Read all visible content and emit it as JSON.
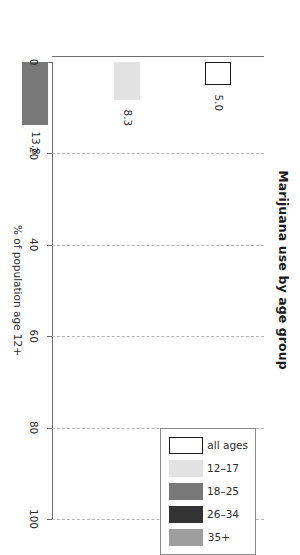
{
  "chart_data": {
    "type": "bar",
    "title": "Marijuana use by age group",
    "orientation": "vertical",
    "categories": [
      "all ages",
      "12–17",
      "18–25",
      "26–34",
      "35+"
    ],
    "values": [
      5.0,
      8.3,
      13.8,
      5.5,
      2.5
    ],
    "value_labels": [
      "5.0",
      "8.3",
      "13.8",
      "5.5",
      "2.5"
    ],
    "xlabel": "",
    "ylabel": "% of population age 12+",
    "ylim": [
      0,
      100
    ],
    "yticks": [
      0,
      20,
      40,
      60,
      80,
      100
    ],
    "ytick_labels": [
      "0",
      "20",
      "40",
      "60",
      "80",
      "100"
    ],
    "grid": true,
    "grid_style": "dashed",
    "legend_position": "top-right",
    "legend_entries": [
      {
        "label": "all ages",
        "color": "#ffffff",
        "edge": "#1a1a1a"
      },
      {
        "label": "12–17",
        "color": "#e2e2e2",
        "edge": "#e2e2e2"
      },
      {
        "label": "18–25",
        "color": "#787878",
        "edge": "#787878"
      },
      {
        "label": "26–34",
        "color": "#333333",
        "edge": "#333333"
      },
      {
        "label": "35+",
        "color": "#9e9e9e",
        "edge": "#9e9e9e"
      }
    ],
    "bar_colors": [
      "#ffffff",
      "#e2e2e2",
      "#787878",
      "#333333",
      "#9e9e9e"
    ],
    "bar_edge_colors": [
      "#1a1a1a",
      "#e2e2e2",
      "#787878",
      "#333333",
      "#9e9e9e"
    ]
  },
  "figure": {
    "title": "Marijuana use by age group",
    "axis_title": "% of population age 12+",
    "background_color": "#ffffff",
    "grid_color": "#b9b9b9",
    "axis_color": "#6e6e6e",
    "text_color": "#2b2b2b"
  }
}
